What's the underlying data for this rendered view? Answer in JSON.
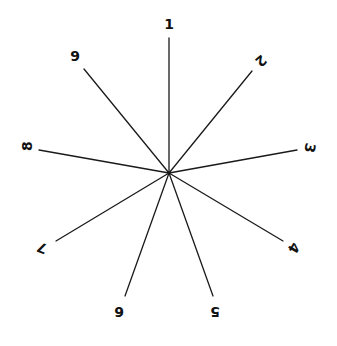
{
  "diagram": {
    "type": "radial-spoke-diagram",
    "center": {
      "x": 169,
      "y": 173
    },
    "line_color": "#1a1a1a",
    "label_color": "#111111",
    "spokes": [
      {
        "label": "1",
        "x2": 169,
        "y2": 38,
        "lx": 169,
        "ly": 24,
        "rot": 0
      },
      {
        "label": "2",
        "x2": 252,
        "y2": 71,
        "lx": 261,
        "ly": 61,
        "rot": 140
      },
      {
        "label": "3",
        "x2": 297,
        "y2": 150,
        "lx": 310,
        "ly": 148,
        "rot": 100
      },
      {
        "label": "4",
        "x2": 283,
        "y2": 241,
        "lx": 294,
        "ly": 248,
        "rot": 120
      },
      {
        "label": "5",
        "x2": 213,
        "y2": 296,
        "lx": 215,
        "ly": 312,
        "rot": 180
      },
      {
        "label": "6",
        "x2": 125,
        "y2": 296,
        "lx": 119,
        "ly": 312,
        "rot": 180
      },
      {
        "label": "7",
        "x2": 56,
        "y2": 241,
        "lx": 42,
        "ly": 248,
        "rot": 200
      },
      {
        "label": "8",
        "x2": 39,
        "y2": 150,
        "lx": 27,
        "ly": 146,
        "rot": 270
      },
      {
        "label": "9",
        "x2": 84,
        "y2": 69,
        "lx": 75,
        "ly": 56,
        "rot": 0
      }
    ]
  }
}
